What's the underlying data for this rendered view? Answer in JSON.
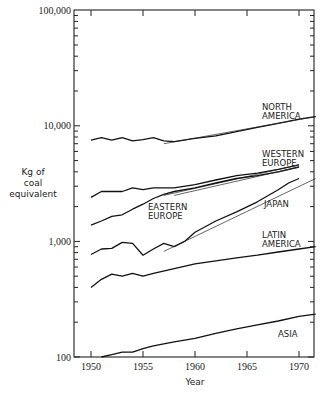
{
  "chart_data": {
    "type": "line",
    "title": "",
    "xlabel": "Year",
    "ylabel": "Kg of coal equivalent",
    "ylabel_lines": [
      "Kg of",
      "coal",
      "equivalent"
    ],
    "yscale": "log",
    "ylim": [
      100,
      100000
    ],
    "xlim": [
      1948.4,
      1971.6
    ],
    "x_ticks": [
      1950,
      1955,
      1960,
      1965,
      1970
    ],
    "x_tick_labels": [
      "1950",
      "1955",
      "1960",
      "1965",
      "1970"
    ],
    "y_ticks": [
      100,
      1000,
      10000,
      100000
    ],
    "y_tick_labels": [
      "100",
      "1,000",
      "10,000",
      "100,000"
    ],
    "grid": false,
    "legend": "inline labels",
    "series": [
      {
        "name": "NORTH AMERICA",
        "label_lines": [
          "NORTH",
          "AMERICA"
        ],
        "x": [
          1950,
          1951,
          1952,
          1953,
          1954,
          1955,
          1956,
          1957,
          1958,
          1960,
          1962,
          1964,
          1966,
          1968,
          1970,
          1971.6
        ],
        "values": [
          7500,
          7900,
          7500,
          7900,
          7400,
          7600,
          7900,
          7400,
          7300,
          7800,
          8200,
          8900,
          9700,
          10500,
          11400,
          12000
        ],
        "trend": {
          "x": [
            1957,
            1971.6
          ],
          "values": [
            7000,
            12000
          ]
        }
      },
      {
        "name": "WESTERN EUROPE",
        "label_lines": [
          "WESTERN",
          "EUROPE"
        ],
        "x": [
          1950,
          1951,
          1952,
          1953,
          1954,
          1955,
          1956,
          1957,
          1958,
          1960,
          1962,
          1964,
          1966,
          1968,
          1970
        ],
        "values": [
          2400,
          2700,
          2700,
          2700,
          2900,
          2800,
          2900,
          2900,
          2900,
          3100,
          3400,
          3700,
          3900,
          4200,
          4600
        ],
        "trend": {
          "x": [
            1957,
            1970
          ],
          "values": [
            2500,
            4600
          ]
        }
      },
      {
        "name": "EASTERN EUROPE",
        "label_lines": [
          "EASTERN",
          "EUROPE"
        ],
        "x": [
          1950,
          1951,
          1952,
          1953,
          1954,
          1955,
          1956,
          1957,
          1958,
          1960,
          1962,
          1964,
          1966,
          1968,
          1970
        ],
        "values": [
          1380,
          1500,
          1650,
          1700,
          1900,
          2100,
          2350,
          2550,
          2700,
          2900,
          3200,
          3500,
          3700,
          4000,
          4400
        ],
        "trend": {
          "x": [
            1958,
            1970
          ],
          "values": [
            2500,
            4400
          ]
        }
      },
      {
        "name": "JAPAN",
        "label_lines": [
          "JAPAN"
        ],
        "x": [
          1950,
          1951,
          1952,
          1953,
          1954,
          1955,
          1956,
          1957,
          1958,
          1959,
          1960,
          1962,
          1964,
          1966,
          1968,
          1969,
          1970
        ],
        "values": [
          770,
          860,
          870,
          980,
          960,
          760,
          860,
          960,
          900,
          1000,
          1200,
          1500,
          1800,
          2200,
          2800,
          3200,
          3500
        ],
        "trend": {
          "x": [
            1957,
            1971.6
          ],
          "values": [
            820,
            3500
          ]
        }
      },
      {
        "name": "LATIN AMERICA",
        "label_lines": [
          "LATIN",
          "AMERICA"
        ],
        "x": [
          1950,
          1951,
          1952,
          1953,
          1954,
          1955,
          1956,
          1958,
          1960,
          1962,
          1964,
          1966,
          1968,
          1970,
          1971.6
        ],
        "values": [
          400,
          470,
          520,
          500,
          530,
          500,
          530,
          580,
          640,
          680,
          720,
          760,
          810,
          860,
          900
        ]
      },
      {
        "name": "ASIA",
        "label_lines": [
          "ASIA"
        ],
        "x": [
          1951,
          1952,
          1953,
          1954,
          1955,
          1956,
          1958,
          1960,
          1962,
          1964,
          1966,
          1968,
          1970,
          1971.6
        ],
        "values": [
          100,
          105,
          110,
          110,
          118,
          125,
          135,
          145,
          160,
          175,
          190,
          205,
          225,
          235
        ]
      }
    ]
  }
}
